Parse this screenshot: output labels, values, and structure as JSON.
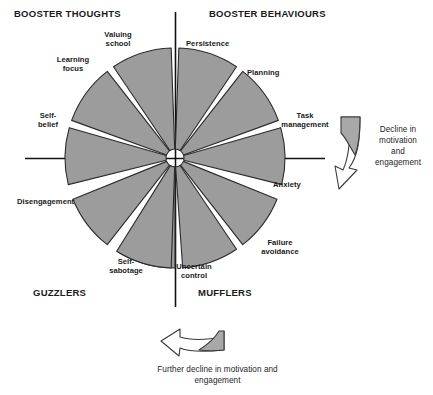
{
  "diagram": {
    "type": "motivation-wheel",
    "center": {
      "x": 175,
      "y": 158
    },
    "radius": 110,
    "colors": {
      "wedge_fill": "#9c9c9c",
      "wedge_stroke": "#2b2b2b",
      "axis": "#111111",
      "arrow_fill": "#a8a8a8",
      "arrow_stroke": "#3a3a3a",
      "text": "#1a1a1a",
      "background": "#ffffff"
    },
    "quadrant_titles": [
      {
        "id": "booster-thoughts",
        "label": "BOOSTER THOUGHTS",
        "quadrant": "top-left"
      },
      {
        "id": "booster-behaviours",
        "label": "BOOSTER BEHAVIOURS",
        "quadrant": "top-right"
      },
      {
        "id": "guzzlers",
        "label": "GUZZLERS",
        "quadrant": "bottom-left"
      },
      {
        "id": "mufflers",
        "label": "MUFFLERS",
        "quadrant": "bottom-right"
      }
    ],
    "wedges": [
      {
        "id": "persistence",
        "label": "Persistence",
        "quadrant": "booster-behaviours",
        "start_angle": -88,
        "end_angle": -56
      },
      {
        "id": "planning",
        "label": "Planning",
        "quadrant": "booster-behaviours",
        "start_angle": -52,
        "end_angle": -20
      },
      {
        "id": "task-management",
        "label": "Task\nmanagement",
        "quadrant": "booster-behaviours",
        "start_angle": -16,
        "end_angle": 14
      },
      {
        "id": "anxiety",
        "label": "Anxiety",
        "quadrant": "mufflers",
        "start_angle": 22,
        "end_angle": 52
      },
      {
        "id": "failure-avoidance",
        "label": "Failure\navoidance",
        "quadrant": "mufflers",
        "start_angle": 56,
        "end_angle": 86
      },
      {
        "id": "uncertain-control",
        "label": "Uncertain\ncontrol",
        "quadrant": "mufflers",
        "start_angle": 90,
        "end_angle": 120
      },
      {
        "id": "self-sabotage",
        "label": "Self-\nsabotage",
        "quadrant": "guzzlers",
        "start_angle": 58,
        "end_angle": 88
      },
      {
        "id": "disengagement",
        "label": "Disengagement",
        "quadrant": "guzzlers",
        "start_angle": 22,
        "end_angle": 52
      },
      {
        "id": "self-belief",
        "label": "Self-\nbelief",
        "quadrant": "booster-thoughts",
        "start_angle": -16,
        "end_angle": 14
      },
      {
        "id": "learning-focus",
        "label": "Learning\nfocus",
        "quadrant": "booster-thoughts",
        "start_angle": -52,
        "end_angle": -20
      },
      {
        "id": "valuing-school",
        "label": "Valuing\nschool",
        "quadrant": "booster-thoughts",
        "start_angle": -88,
        "end_angle": -56
      }
    ],
    "arrows": [
      {
        "id": "right-arrow",
        "label": "Decline in\nmotivation\nand\nengagement",
        "direction": "down",
        "position": "right"
      },
      {
        "id": "bottom-arrow",
        "label": "Further decline in motivation and\nengagement",
        "direction": "left",
        "position": "bottom"
      }
    ]
  }
}
